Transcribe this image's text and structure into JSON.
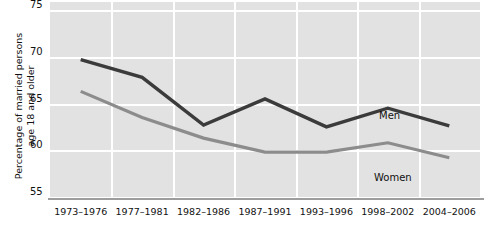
{
  "chart_data": {
    "type": "line",
    "title": "",
    "xlabel": "",
    "ylabel": "Percentage of married persons\nage 18 and older",
    "ylim": [
      55,
      75
    ],
    "yticks": [
      75,
      70,
      65,
      60,
      55
    ],
    "ytick_labels": [
      "75",
      "70",
      "65",
      "60",
      "55"
    ],
    "grid": true,
    "legend_position": "inline-labels",
    "categories": [
      "1973–1976",
      "1977–1981",
      "1982–1986",
      "1987–1991",
      "1993–1996",
      "1998–2002",
      "2004–2006"
    ],
    "series": [
      {
        "name": "Men",
        "color": "#3b3b3b",
        "values": [
          69.7,
          67.8,
          62.7,
          65.5,
          62.5,
          64.5,
          62.6
        ]
      },
      {
        "name": "Women",
        "color": "#8c8c8c",
        "values": [
          66.3,
          63.5,
          61.3,
          59.8,
          59.8,
          60.8,
          59.2
        ]
      }
    ],
    "annotations": [
      {
        "text": "Men",
        "series": "Men"
      },
      {
        "text": "Women",
        "series": "Women"
      }
    ]
  },
  "axis": {
    "y_title_line1": "Percentage of married persons",
    "y_title_line2": "age 18 and older"
  },
  "colors": {
    "plot_background": "#e2e2e2",
    "gridline": "#ffffff",
    "axis_line": "#9d9d9d",
    "men_line": "#3b3b3b",
    "women_line": "#8c8c8c",
    "text": "#111111"
  }
}
